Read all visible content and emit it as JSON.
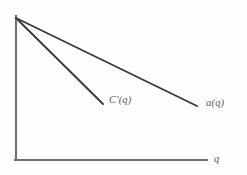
{
  "figure": {
    "background_color": "#fefefe",
    "axis_color": "#6f6f6f",
    "curve_color": "#3a3a3a",
    "label_color": "#585858",
    "labels": {
      "marginal_cost": "C'(q)",
      "demand": "a(q)",
      "x_axis": "q"
    }
  },
  "chart_data": {
    "type": "line",
    "title": "",
    "xlabel": "q",
    "ylabel": "",
    "grid": false,
    "legend": "inline-end-labels",
    "xlim": [
      0,
      207
    ],
    "ylim": [
      0,
      160
    ],
    "axes": {
      "y_axis": {
        "x": 16,
        "y_top": 16,
        "y_bottom": 160
      },
      "x_axis": {
        "y": 160,
        "x_left": 16,
        "x_right": 207
      }
    },
    "series": [
      {
        "name": "a(q)",
        "label": "a(q)",
        "points": [
          {
            "x": 16,
            "y": 18
          },
          {
            "x": 197,
            "y": 106
          }
        ],
        "slope": -0.486,
        "annotation_at": {
          "x": 206,
          "y": 98
        }
      },
      {
        "name": "C'(q)",
        "label": "C'(q)",
        "points": [
          {
            "x": 16,
            "y": 18
          },
          {
            "x": 103,
            "y": 104
          }
        ],
        "slope": -0.989,
        "annotation_at": {
          "x": 109,
          "y": 95
        }
      }
    ]
  }
}
